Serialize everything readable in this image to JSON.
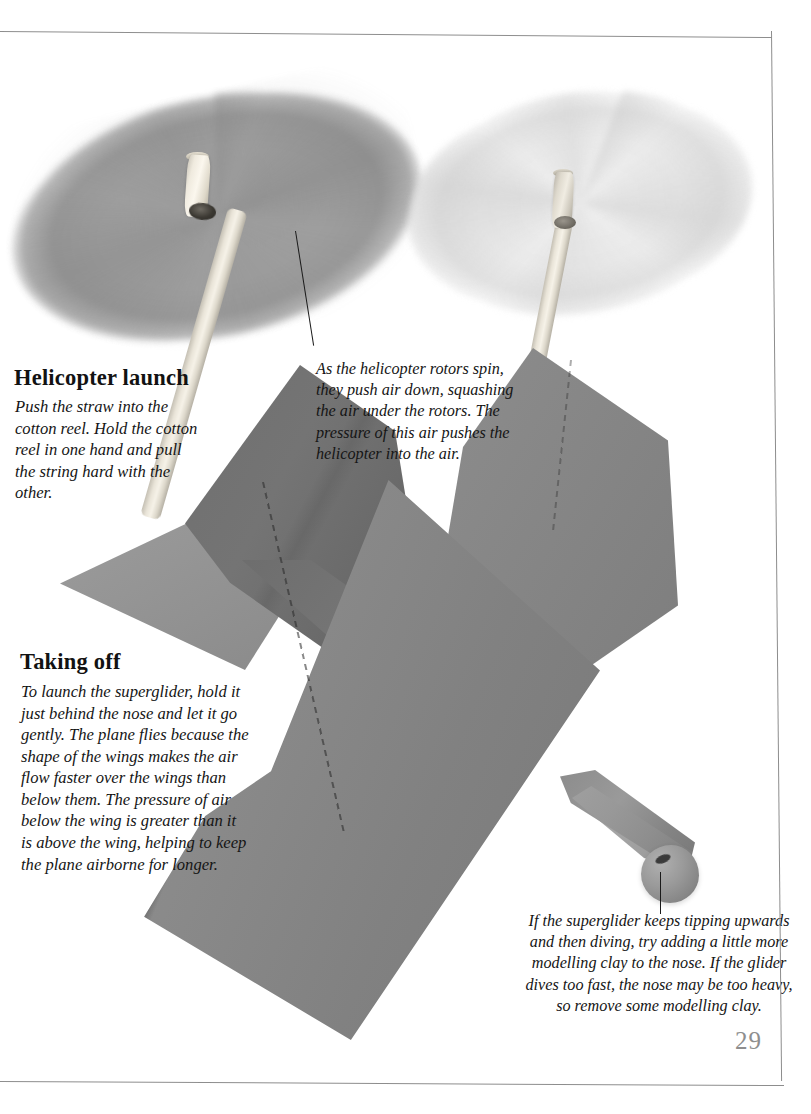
{
  "page": {
    "page_number": "29",
    "background_color": "#ffffff",
    "border_color": "#8d8d8d"
  },
  "sections": {
    "helicopter": {
      "heading": "Helicopter launch",
      "body": "Push the straw into the cotton reel. Hold the cotton reel in one hand and pull the string hard with the other."
    },
    "taking_off": {
      "heading": "Taking off",
      "body": "To launch the superglider, hold it just behind the nose and let it go gently. The plane flies because the shape of the wings makes the air flow faster over the wings than below them. The pressure of air below the wing is greater than it is above the wing, helping to keep the plane airborne for longer."
    }
  },
  "captions": {
    "rotor": "As the helicopter rotors spin, they push air down, squashing the air under the rotors. The pressure of this air pushes the helicopter into the air.",
    "glider_nose": "If the superglider keeps tipping upwards and then diving, try adding a little more modelling clay to the nose. If the glider dives too fast, the nose may be too heavy, so remove some modelling clay."
  },
  "photo_objects": {
    "rotor_left": "spinning-card-rotor-dark",
    "rotor_right": "spinning-card-rotor-light",
    "reel_left": "cotton-reel-with-straw",
    "reel_right": "cotton-reel-with-straw",
    "straw_left": "drinking-straw-shaft",
    "straw_right": "drinking-straw-shaft",
    "tail_fin": "paper-glider-tail-fin",
    "tailplane": "paper-glider-tailplane",
    "wing_main": "paper-glider-main-wing",
    "wing_upper": "paper-glider-upper-wing",
    "nose_clay": "modelling-clay-ball-nose"
  },
  "colors": {
    "card_dark_gray": "#6f6f6f",
    "card_mid_gray": "#8a8a8a",
    "card_light_gray": "#9c9c9c",
    "straw_cream": "#f0ece2",
    "clay_gray": "#9a9a9a",
    "page_number_gray": "#8e8e8e",
    "text_black": "#1a1a1a"
  }
}
